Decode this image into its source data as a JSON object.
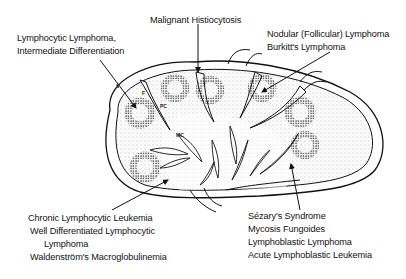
{
  "diagram": {
    "internal_labels": {
      "sinus": "S",
      "follicle": "F",
      "paracortex": "PC",
      "medullary_cords": "MC"
    },
    "annotations": {
      "top_left": {
        "lines": [
          "Lymphocytic Lymphoma,",
          "Intermediate Differentiation"
        ]
      },
      "top_center": {
        "lines": [
          "Malignant Histiocytosis"
        ]
      },
      "top_right": {
        "lines": [
          "Nodular (Follicular) Lymphoma",
          "Burkitt's Lymphoma"
        ]
      },
      "bottom_left": {
        "lines": [
          "Chronic Lymphocytic Leukemia",
          "Well Differentiated Lymphocytic",
          "Lymphoma",
          "Waldenström's Macroglobulinemia"
        ]
      },
      "bottom_right": {
        "lines": [
          "Sézary's Syndrome",
          "Mycosis Fungoides",
          "Lymphoblastic Lymphoma",
          "Acute Lymphoblastic Leukemia"
        ]
      }
    },
    "colors": {
      "ink": "#111111",
      "stipple": "#555555",
      "background": "#ffffff"
    }
  }
}
